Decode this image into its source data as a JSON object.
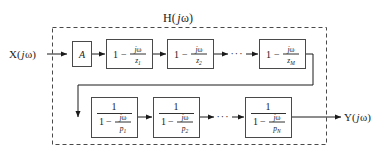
{
  "figure": {
    "title_parts": {
      "h": "H(",
      "j": "j",
      "omega": "ω",
      "close": ")"
    },
    "input_label": "X( jω)",
    "output_label": "Y( jω)",
    "gain_label": "A",
    "ellipsis": "···",
    "numerator_one": "1",
    "minus": "−",
    "j_symbol": "j",
    "omega_symbol": "ω",
    "colors": {
      "stroke": "#1a1a1a",
      "box_stroke": "#4a4a4a",
      "dashed_stroke": "#4a4a4a",
      "background": "#ffffff"
    },
    "zero_blocks": [
      {
        "name": "zero-1",
        "lead": "1",
        "op": "−",
        "num_j": "j",
        "num_omega": "ω",
        "den_var": "z",
        "den_sub": "1"
      },
      {
        "name": "zero-2",
        "lead": "1",
        "op": "−",
        "num_j": "j",
        "num_omega": "ω",
        "den_var": "z",
        "den_sub": "2"
      },
      {
        "name": "zero-M",
        "lead": "1",
        "op": "−",
        "num_j": "j",
        "num_omega": "ω",
        "den_var": "z",
        "den_sub": "M"
      }
    ],
    "pole_blocks": [
      {
        "name": "pole-1",
        "numerator": "1",
        "lead": "1",
        "op": "−",
        "num_j": "j",
        "num_omega": "ω",
        "den_var": "p",
        "den_sub": "1"
      },
      {
        "name": "pole-2",
        "numerator": "1",
        "lead": "1",
        "op": "−",
        "num_j": "j",
        "num_omega": "ω",
        "den_var": "p",
        "den_sub": "2"
      },
      {
        "name": "pole-N",
        "numerator": "1",
        "lead": "1",
        "op": "−",
        "num_j": "j",
        "num_omega": "ω",
        "den_var": "p",
        "den_sub": "N"
      }
    ]
  }
}
